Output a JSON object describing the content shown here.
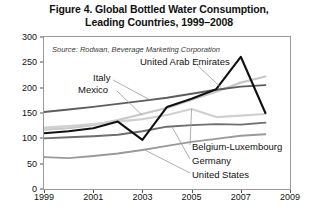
{
  "figure": {
    "title_line1": "Figure 4. Global Bottled Water Consumption,",
    "title_line2": "Leading Countries, 1999–2008",
    "source": "Source: Rodwan, Beverage Marketing Corporation"
  },
  "annotations": {
    "uae": "United Arab Emirates",
    "italy": "Italy",
    "mexico": "Mexico",
    "belgium": "Belgium-Luxembourg",
    "germany": "Germany",
    "united_states": "United States"
  },
  "axes": {
    "y_ticks": [
      "0",
      "50",
      "100",
      "150",
      "200",
      "250",
      "300"
    ],
    "x_ticks": [
      "1999",
      "2001",
      "2003",
      "2005",
      "2007",
      "2009"
    ]
  },
  "colors": {
    "uae": "#111111",
    "italy": "#5d5d5d",
    "mexico": "#c9c9c9",
    "belgium": "#d0d0d0",
    "germany": "#6e6e6e",
    "united_states": "#9a9a9a",
    "frame": "#9a9a9a",
    "text": "#111111"
  },
  "chart_data": {
    "type": "line",
    "title": "Figure 4. Global Bottled Water Consumption, Leading Countries, 1999–2008",
    "xlabel": "",
    "ylabel": "Liters per Person",
    "xlim": [
      1999,
      2009
    ],
    "ylim": [
      0,
      300
    ],
    "grid": false,
    "legend": "annotations-inline",
    "x": [
      1999,
      2000,
      2001,
      2002,
      2003,
      2004,
      2005,
      2006,
      2007,
      2008
    ],
    "series": [
      {
        "name": "United Arab Emirates",
        "values": [
          110,
          114,
          120,
          133,
          97,
          162,
          178,
          197,
          261,
          150
        ]
      },
      {
        "name": "Italy",
        "values": [
          152,
          157,
          162,
          168,
          174,
          180,
          188,
          196,
          202,
          205
        ]
      },
      {
        "name": "Mexico",
        "values": [
          117,
          120,
          126,
          136,
          148,
          160,
          176,
          192,
          210,
          222
        ]
      },
      {
        "name": "Belgium-Luxembourg",
        "values": [
          121,
          124,
          128,
          133,
          138,
          146,
          158,
          142,
          145,
          148
        ]
      },
      {
        "name": "Germany",
        "values": [
          100,
          102,
          104,
          107,
          114,
          123,
          126,
          128,
          127,
          131
        ]
      },
      {
        "name": "United States",
        "values": [
          63,
          61,
          65,
          70,
          77,
          85,
          93,
          99,
          105,
          108
        ]
      }
    ]
  }
}
